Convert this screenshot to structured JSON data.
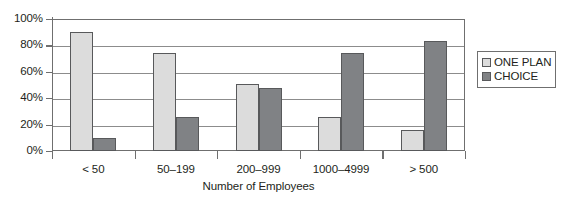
{
  "chart_data": {
    "type": "bar",
    "title": "",
    "subtitle": "",
    "xlabel": "Number of Employees",
    "ylabel": "",
    "categories": [
      "< 50",
      "50–199",
      "200–999",
      "1000–4999",
      "> 500"
    ],
    "series": [
      {
        "name": "ONE PLAN",
        "color": "#dcdcdc",
        "values": [
          90,
          74,
          51,
          26,
          16
        ]
      },
      {
        "name": "CHOICE",
        "color": "#808285",
        "values": [
          10,
          26,
          48,
          74,
          83
        ]
      }
    ],
    "ylim": [
      0,
      100
    ],
    "ytick_values": [
      0,
      20,
      40,
      60,
      80,
      100
    ],
    "ytick_labels": [
      "0%",
      "20%",
      "40%",
      "60%",
      "80%",
      "100%"
    ],
    "grid": "horizontal",
    "legend_position": "right",
    "legend_border": true,
    "value_suffix": "%",
    "bar_border_color": "#58595b",
    "axis_color": "#6f6f6f",
    "gridline_color": "#8c8c8c",
    "background_color": "#ffffff"
  }
}
